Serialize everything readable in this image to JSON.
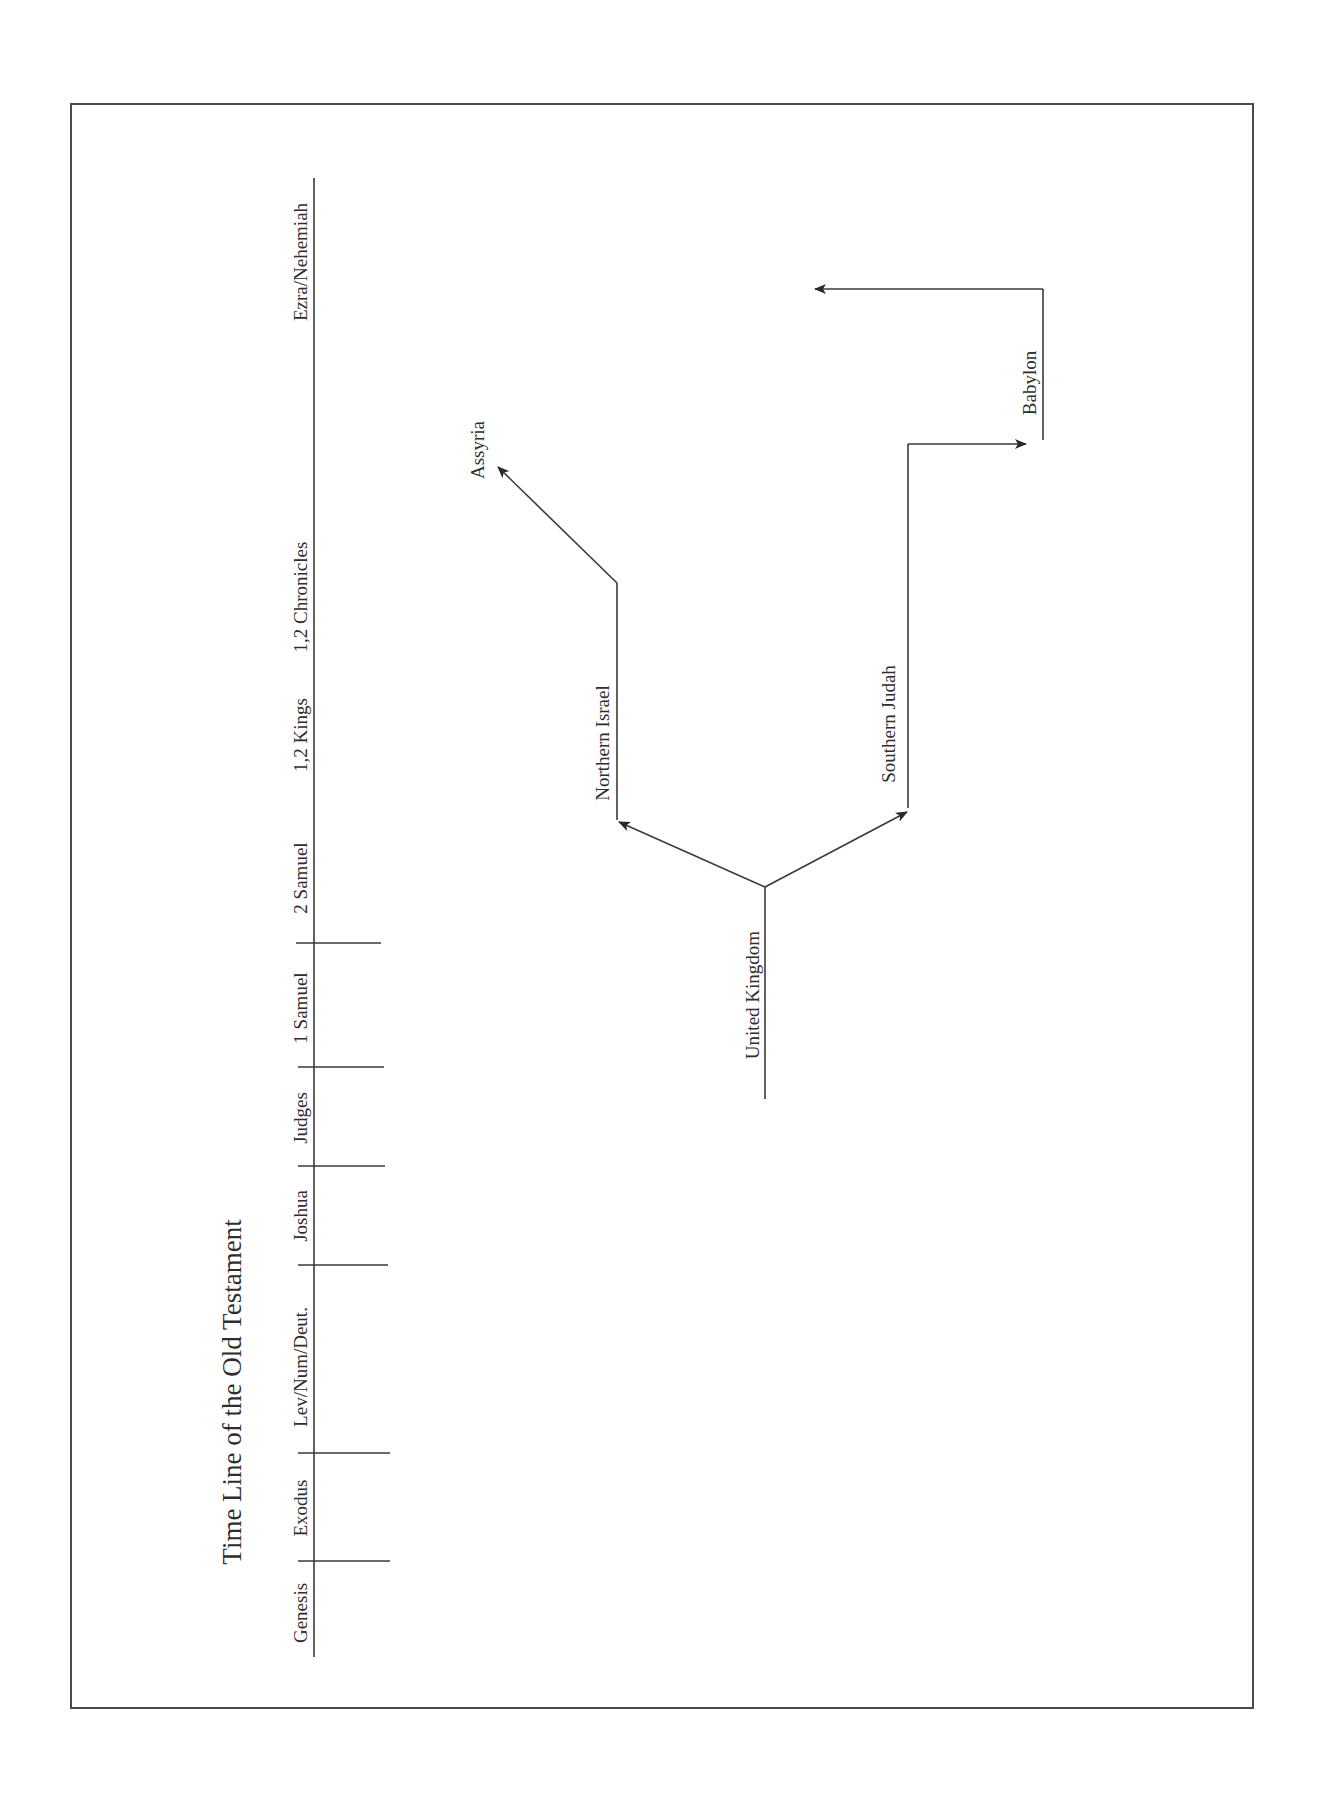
{
  "title": "Time Line of the Old Testament",
  "timeline": {
    "books": [
      {
        "label": "Genesis",
        "y": 1613
      },
      {
        "label": "Exodus",
        "y": 1508
      },
      {
        "label": "Lev/Num/Deut.",
        "y": 1367
      },
      {
        "label": "Joshua",
        "y": 1216
      },
      {
        "label": "Judges",
        "y": 1118
      },
      {
        "label": "1 Samuel",
        "y": 1008
      },
      {
        "label": "2 Samuel",
        "y": 878
      },
      {
        "label": "1,2 Kings",
        "y": 735
      },
      {
        "label": "1,2 Chronicles",
        "y": 597
      },
      {
        "label": "Ezra/Nehemiah",
        "y": 262
      }
    ],
    "tick_positions_y": [
      1561,
      1453,
      1265,
      1166,
      1067,
      943
    ]
  },
  "diagram": {
    "nodes": {
      "united_kingdom": "United Kingdom",
      "northern_israel": "Northern Israel",
      "southern_judah": "Southern Judah",
      "assyria": "Assyria",
      "babylon": "Babylon"
    },
    "edges": [
      {
        "from": "United Kingdom",
        "to": "Northern Israel"
      },
      {
        "from": "United Kingdom",
        "to": "Southern Judah"
      },
      {
        "from": "Northern Israel",
        "to": "Assyria"
      },
      {
        "from": "Southern Judah",
        "to": "Babylon"
      },
      {
        "from": "Babylon",
        "to": "return (Ezra/Nehemiah)"
      }
    ]
  },
  "colors": {
    "line": "#3a3a3a",
    "text": "#2e2e2e",
    "background": "#ffffff"
  }
}
